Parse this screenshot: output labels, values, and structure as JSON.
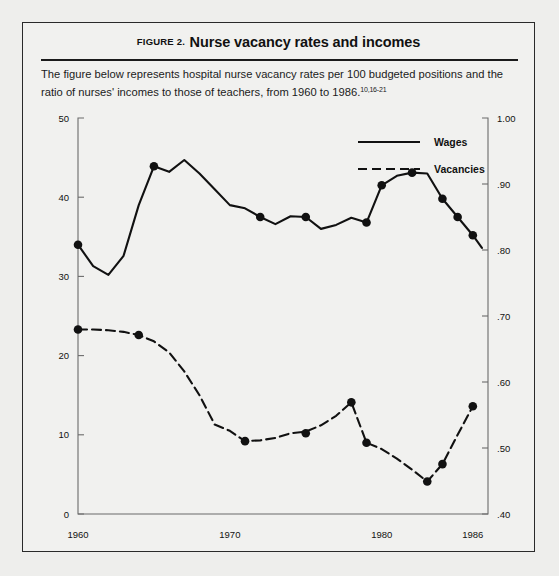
{
  "figure": {
    "label": "FIGURE 2.",
    "title": "Nurse vacancy rates and incomes",
    "caption_line1": "The figure below represents hospital nurse vacancy rates per 100 budgeted positions and the ratio",
    "caption_line2": "of nurses' incomes to those of teachers, from 1960 to 1986.",
    "caption_refs": "10,16-21"
  },
  "chart_data": {
    "type": "line",
    "title": "Nurse vacancy rates and incomes",
    "xlabel": "",
    "ylabel": "",
    "xlim": [
      1960,
      1987
    ],
    "ylim": [
      0,
      50
    ],
    "y2lim": [
      0.4,
      1.0
    ],
    "grid": false,
    "legend_position": "top-center",
    "x_ticks": [
      "1960",
      "1970",
      "1980",
      "1986"
    ],
    "x_tick_values": [
      1960,
      1970,
      1980,
      1986
    ],
    "y_ticks": [
      "0",
      "10",
      "20",
      "30",
      "40",
      "50"
    ],
    "y_tick_values": [
      0,
      10,
      20,
      30,
      40,
      50
    ],
    "y2_ticks": [
      ".40",
      ".50",
      ".60",
      ".70",
      ".80",
      ".90",
      "1.00"
    ],
    "y2_tick_values": [
      0.4,
      0.5,
      0.6,
      0.7,
      0.8,
      0.9,
      1.0
    ],
    "series": [
      {
        "name": "Wages",
        "style": "solid",
        "axis": "right",
        "x": [
          1960,
          1961,
          1962,
          1963,
          1964,
          1965,
          1966,
          1967,
          1968,
          1969,
          1970,
          1971,
          1972,
          1973,
          1974,
          1975,
          1976,
          1977,
          1978,
          1979,
          1980,
          1981,
          1982,
          1983,
          1984,
          1985,
          1986
        ],
        "values": [
          34.0,
          31.3,
          30.2,
          32.6,
          39.0,
          43.9,
          43.2,
          44.7,
          43.0,
          41.0,
          39.0,
          38.6,
          37.5,
          36.6,
          37.6,
          37.5,
          36.0,
          36.5,
          37.4,
          36.8,
          41.5,
          42.7,
          43.1,
          43.0,
          39.8,
          37.5,
          35.2
        ],
        "marked_x": [
          1960,
          1965,
          1972,
          1975,
          1979,
          1980,
          1982,
          1984,
          1985,
          1986
        ],
        "marked_values": [
          34.0,
          43.9,
          37.5,
          37.5,
          36.8,
          41.5,
          43.1,
          39.8,
          37.5,
          35.2
        ],
        "end_x": 1986.6,
        "end_value": 33.6
      },
      {
        "name": "Vacancies",
        "style": "dashed",
        "axis": "left",
        "x": [
          1960,
          1961,
          1962,
          1963,
          1964,
          1965,
          1966,
          1967,
          1968,
          1969,
          1970,
          1971,
          1972,
          1973,
          1974,
          1975,
          1976,
          1977,
          1978,
          1979,
          1980,
          1981,
          1982,
          1983,
          1984,
          1985,
          1986
        ],
        "values": [
          23.3,
          23.3,
          23.2,
          23.0,
          22.6,
          21.8,
          20.4,
          18.0,
          15.0,
          11.3,
          10.5,
          9.2,
          9.3,
          9.6,
          10.2,
          10.4,
          11.2,
          12.4,
          14.1,
          9.0,
          8.2,
          7.0,
          5.6,
          4.1,
          6.3,
          10.0,
          13.6
        ],
        "marked_x": [
          1960,
          1964,
          1971,
          1975,
          1978,
          1979,
          1983,
          1984,
          1986
        ],
        "marked_values": [
          23.3,
          22.6,
          9.2,
          10.2,
          14.1,
          9.0,
          4.1,
          6.3,
          13.6
        ]
      }
    ],
    "legend": [
      {
        "label": "Wages",
        "style": "solid"
      },
      {
        "label": "Vacancies",
        "style": "dashed"
      }
    ]
  }
}
